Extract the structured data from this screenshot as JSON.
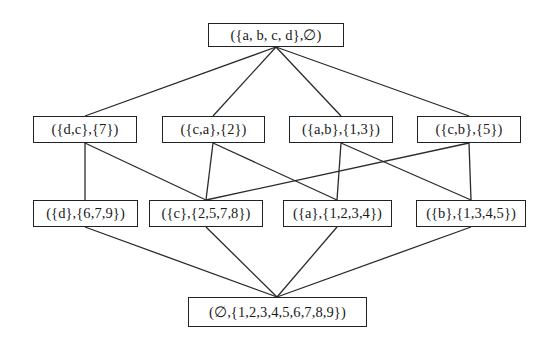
{
  "diagram": {
    "type": "concept-lattice",
    "nodes": [
      {
        "id": "top",
        "label": "({a, b, c, d},∅)",
        "x": 208,
        "y": 23,
        "w": 136,
        "h": 24
      },
      {
        "id": "dc",
        "label": "({d,c},{7})",
        "x": 33,
        "y": 116,
        "w": 104,
        "h": 27
      },
      {
        "id": "ca",
        "label": "({c,a},{2})",
        "x": 162,
        "y": 116,
        "w": 103,
        "h": 27
      },
      {
        "id": "ab",
        "label": "({a,b},{1,3})",
        "x": 289,
        "y": 116,
        "w": 104,
        "h": 27
      },
      {
        "id": "cb",
        "label": "({c,b},{5})",
        "x": 417,
        "y": 116,
        "w": 104,
        "h": 27
      },
      {
        "id": "d",
        "label": "({d},{6,7,9})",
        "x": 33,
        "y": 200,
        "w": 105,
        "h": 27
      },
      {
        "id": "c",
        "label": "({c},{2,5,7,8})",
        "x": 149,
        "y": 200,
        "w": 114,
        "h": 27
      },
      {
        "id": "a",
        "label": "({a},{1,2,3,4})",
        "x": 283,
        "y": 200,
        "w": 109,
        "h": 27
      },
      {
        "id": "b",
        "label": "({b},{1,3,4,5})",
        "x": 416,
        "y": 200,
        "w": 110,
        "h": 27
      },
      {
        "id": "bottom",
        "label": "(∅,{1,2,3,4,5,6,7,8,9})",
        "x": 188,
        "y": 297,
        "w": 179,
        "h": 30
      }
    ],
    "edges": [
      {
        "from": "top",
        "to": "dc",
        "x1": 276,
        "y1": 47,
        "x2": 85,
        "y2": 116
      },
      {
        "from": "top",
        "to": "ca",
        "x1": 276,
        "y1": 47,
        "x2": 213,
        "y2": 116
      },
      {
        "from": "top",
        "to": "ab",
        "x1": 276,
        "y1": 47,
        "x2": 341,
        "y2": 116
      },
      {
        "from": "top",
        "to": "cb",
        "x1": 276,
        "y1": 47,
        "x2": 469,
        "y2": 116
      },
      {
        "from": "dc",
        "to": "d",
        "x1": 85,
        "y1": 143,
        "x2": 85,
        "y2": 200
      },
      {
        "from": "dc",
        "to": "c",
        "x1": 85,
        "y1": 143,
        "x2": 206,
        "y2": 200
      },
      {
        "from": "ca",
        "to": "c",
        "x1": 213,
        "y1": 143,
        "x2": 206,
        "y2": 200
      },
      {
        "from": "ca",
        "to": "a",
        "x1": 213,
        "y1": 143,
        "x2": 337,
        "y2": 200
      },
      {
        "from": "ab",
        "to": "a",
        "x1": 341,
        "y1": 143,
        "x2": 337,
        "y2": 200
      },
      {
        "from": "ab",
        "to": "b",
        "x1": 341,
        "y1": 143,
        "x2": 471,
        "y2": 200
      },
      {
        "from": "cb",
        "to": "c",
        "x1": 469,
        "y1": 143,
        "x2": 206,
        "y2": 200
      },
      {
        "from": "cb",
        "to": "b",
        "x1": 469,
        "y1": 143,
        "x2": 471,
        "y2": 200
      },
      {
        "from": "d",
        "to": "bottom",
        "x1": 85,
        "y1": 227,
        "x2": 277,
        "y2": 297
      },
      {
        "from": "c",
        "to": "bottom",
        "x1": 206,
        "y1": 227,
        "x2": 277,
        "y2": 297
      },
      {
        "from": "a",
        "to": "bottom",
        "x1": 337,
        "y1": 227,
        "x2": 277,
        "y2": 297
      },
      {
        "from": "b",
        "to": "bottom",
        "x1": 471,
        "y1": 227,
        "x2": 277,
        "y2": 297
      }
    ]
  }
}
